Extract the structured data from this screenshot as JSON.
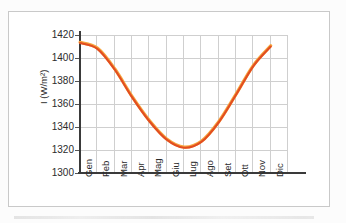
{
  "figure": {
    "frame_border_color": "#c9c9c9",
    "background_color": "#ffffff",
    "page_background": "#fcfcfc"
  },
  "axis": {
    "y_title": "I (W/m²)",
    "y_ticks": [
      "1300",
      "1320",
      "1340",
      "1360",
      "1380",
      "1400",
      "1420"
    ],
    "x_ticks": [
      "Gen",
      "Feb",
      "Mar",
      "Apr",
      "Mag",
      "Giu",
      "Lug",
      "Ago",
      "Set",
      "Ott",
      "Nov",
      "Dic"
    ]
  },
  "style": {
    "line_color": "#e24d21",
    "line_highlight_color": "#f7a43c",
    "gridline_color": "#cfcfcf",
    "axis_color": "#3a3a3a",
    "tick_label_color": "#2b2b2b"
  },
  "chart_data": {
    "type": "line",
    "title": "",
    "subtitle": "",
    "xlabel": "",
    "ylabel": "I (W/m²)",
    "categories": [
      "Gen",
      "Feb",
      "Mar",
      "Apr",
      "Mag",
      "Giu",
      "Lug",
      "Ago",
      "Set",
      "Ott",
      "Nov",
      "Dic"
    ],
    "values": [
      1413,
      1408,
      1390,
      1366,
      1345,
      1329,
      1322,
      1327,
      1344,
      1368,
      1393,
      1410
    ],
    "series": [
      {
        "name": "I (W/m²)",
        "values": [
          1413,
          1408,
          1390,
          1366,
          1345,
          1329,
          1322,
          1327,
          1344,
          1368,
          1393,
          1410
        ],
        "color": "#e24d21"
      }
    ],
    "ylim": [
      1300,
      1420
    ],
    "ytick_step": 20,
    "xlim_categories": 12,
    "grid": "both",
    "legend": "none",
    "smooth": true,
    "markers": false,
    "annotations": []
  }
}
